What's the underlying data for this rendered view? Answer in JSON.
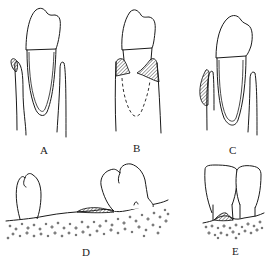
{
  "figure": {
    "panels": [
      {
        "id": "A",
        "label": "A",
        "description": "Tooth with hatched gingival pocket mass on left margin"
      },
      {
        "id": "B",
        "label": "B",
        "description": "Tooth with hatched interproximal tissue both sides, dashed root outline"
      },
      {
        "id": "C",
        "label": "C",
        "description": "Tooth with hatched crescent-shaped lesion on left gingiva"
      },
      {
        "id": "D",
        "label": "D",
        "description": "Edentulous ridge section between two crowns with hatched mound on stippled bone"
      },
      {
        "id": "E",
        "label": "E",
        "description": "Two adjacent incisor crowns with hatched interdental papilla over stippled bone"
      }
    ],
    "colors": {
      "line": "#1a1a1a",
      "background": "#ffffff"
    }
  }
}
